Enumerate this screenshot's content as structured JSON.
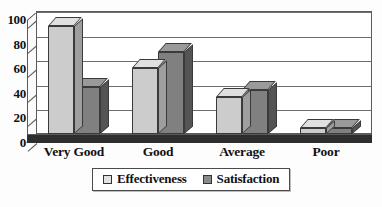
{
  "chart_data": {
    "type": "bar",
    "title": "",
    "subtitle": "",
    "xlabel": "",
    "ylabel": "",
    "categories": [
      "Very Good",
      "Good",
      "Average",
      "Poor"
    ],
    "series": [
      {
        "name": "Effectiveness",
        "values": [
          88,
          54,
          30,
          5
        ],
        "color": "#cccccc"
      },
      {
        "name": "Satisfaction",
        "values": [
          38,
          67,
          36,
          5
        ],
        "color": "#808080"
      }
    ],
    "ylim": [
      0,
      100
    ],
    "yticks": [
      0,
      20,
      40,
      60,
      80,
      100
    ],
    "ytick_labels": [
      "0",
      "20",
      "40",
      "60",
      "80",
      "100"
    ],
    "grid": true,
    "grid_axis": "y",
    "legend_position": "bottom",
    "style": "3d-clustered-bar-grayscale"
  },
  "legend": {
    "items": [
      {
        "label": "Effectiveness",
        "swatch": "light-gray-swatch"
      },
      {
        "label": "Satisfaction",
        "swatch": "dark-gray-swatch"
      }
    ]
  },
  "caption": {
    "text": ""
  },
  "colors": {
    "series_light": "#cccccc",
    "series_dark": "#808080",
    "axis": "#5a5a5a",
    "grid": "#6e6e6e",
    "text": "#111111",
    "floor": "#2e2e2e",
    "background": "#ffffff"
  }
}
